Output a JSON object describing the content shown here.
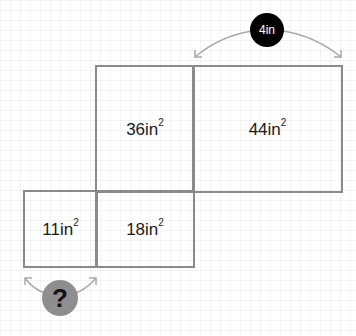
{
  "diagram": {
    "type": "net-area-puzzle",
    "colors": {
      "line": "#8a8a8a",
      "arrow": "#a8a8a8",
      "dim_badge": "#000000",
      "question_badge": "#8e8e8e"
    },
    "faces": [
      {
        "id": "top-left",
        "area_value": "36",
        "unit": "in",
        "exponent": "2"
      },
      {
        "id": "top-right",
        "area_value": "44",
        "unit": "in",
        "exponent": "2"
      },
      {
        "id": "bottom-left",
        "area_value": "11",
        "unit": "in",
        "exponent": "2"
      },
      {
        "id": "bottom-middle",
        "area_value": "18",
        "unit": "in",
        "exponent": "2"
      }
    ],
    "dimension_label": "4in",
    "unknown_label": "?"
  }
}
